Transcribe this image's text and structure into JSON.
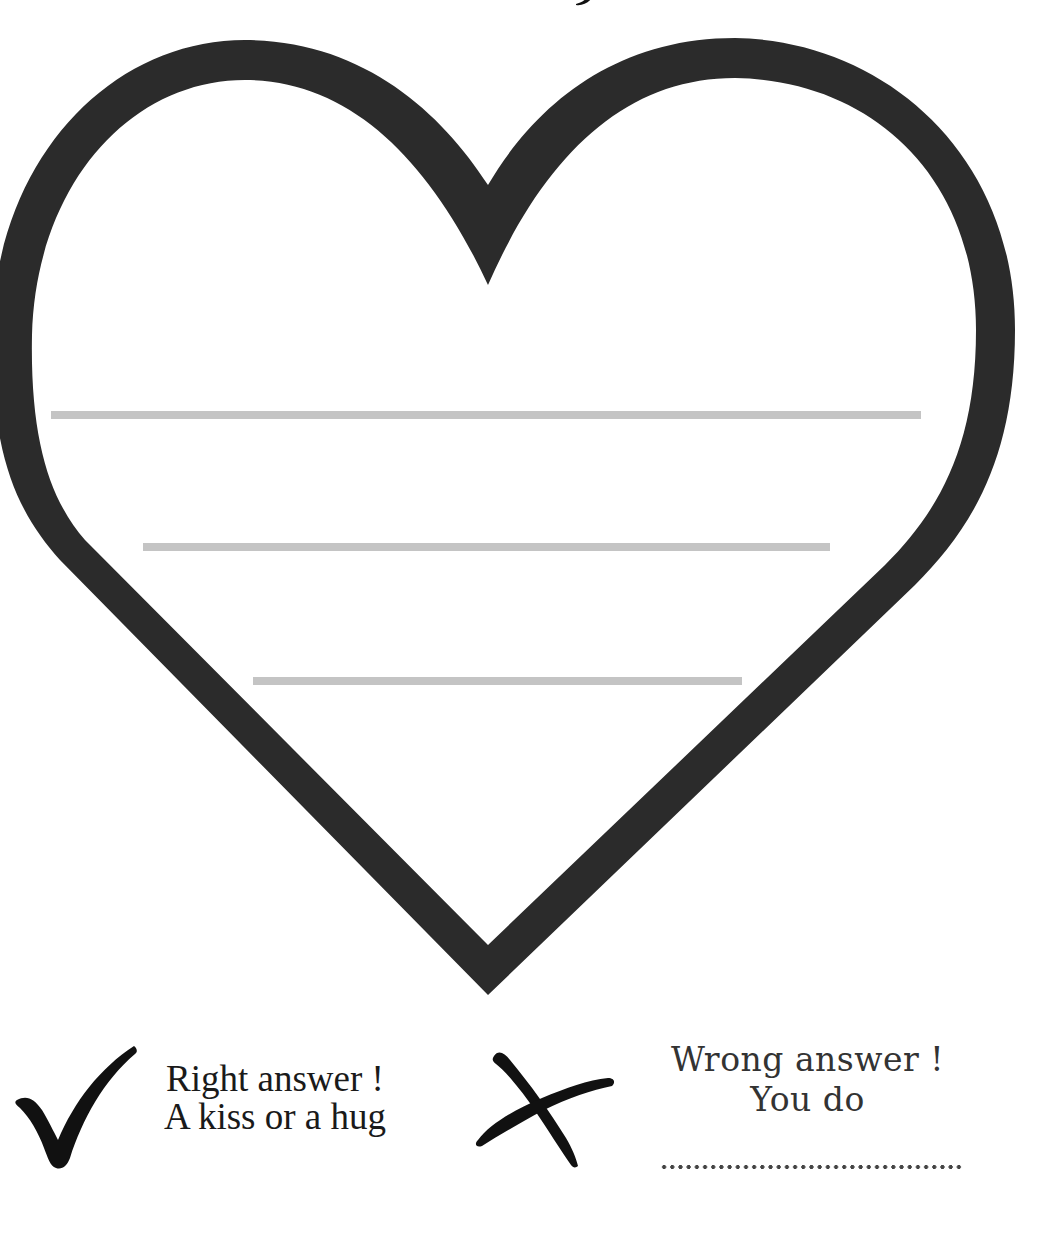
{
  "worksheet": {
    "heart": {
      "stroke_color": "#2b2b2b",
      "fill_color": "#ffffff"
    },
    "writing_lines": [
      {
        "id": "line-1",
        "color": "#c4c4c4"
      },
      {
        "id": "line-2",
        "color": "#c4c4c4"
      },
      {
        "id": "line-3",
        "color": "#c4c4c4"
      }
    ]
  },
  "legend": {
    "right": {
      "icon": "checkmark-icon",
      "line1": "Right answer !",
      "line2": "A kiss or a hug"
    },
    "wrong": {
      "icon": "cross-icon",
      "line1": "Wrong answer !",
      "line2": "You do",
      "fill_in_placeholder": "......................................"
    }
  }
}
